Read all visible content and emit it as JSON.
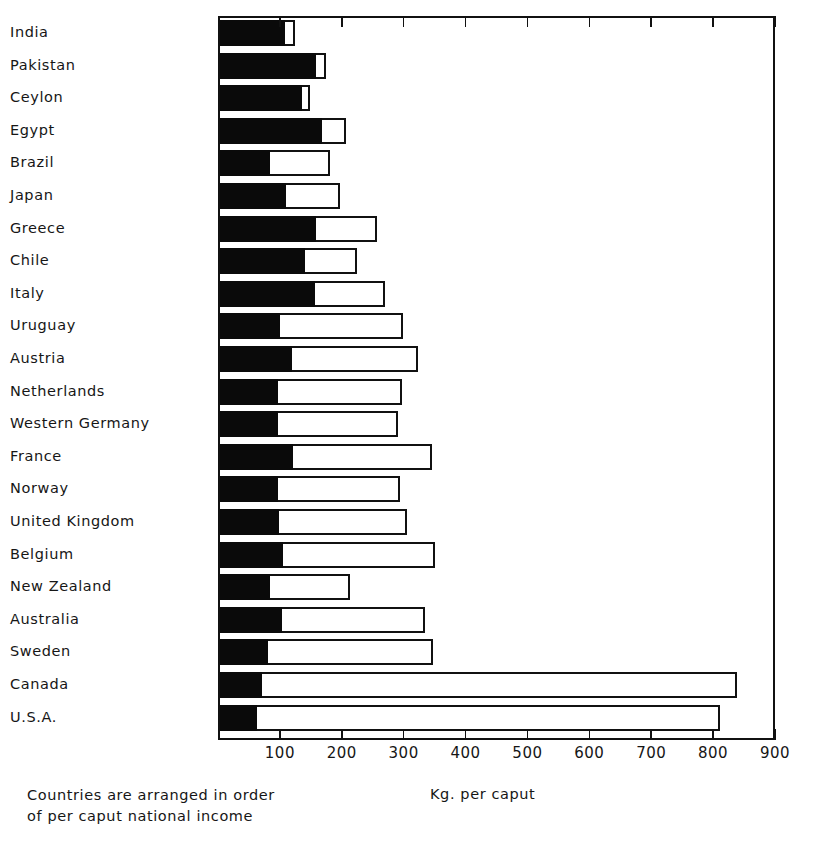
{
  "chart_data": {
    "type": "bar",
    "orientation": "horizontal",
    "stacked": true,
    "title": "",
    "xlabel": "Kg. per caput",
    "ylabel": "",
    "xlim": [
      0,
      900
    ],
    "xticks": [
      100,
      200,
      300,
      400,
      500,
      600,
      700,
      800,
      900
    ],
    "xtick_labels": [
      "100",
      "200",
      "300",
      "400",
      "500",
      "600",
      "700",
      "800",
      "900"
    ],
    "grid": false,
    "legend_position": "none",
    "annotations": [
      "Countries are arranged in order",
      "of per caput national income"
    ],
    "categories": [
      "India",
      "Pakistan",
      "Ceylon",
      "Egypt",
      "Brazil",
      "Japan",
      "Greece",
      "Chile",
      "Italy",
      "Uruguay",
      "Austria",
      "Netherlands",
      "Western Germany",
      "France",
      "Norway",
      "United Kingdom",
      "Belgium",
      "New Zealand",
      "Australia",
      "Sweden",
      "Canada",
      "U.S.A."
    ],
    "series": [
      {
        "name": "direct",
        "color": "#0a0a0a",
        "values": [
          108,
          158,
          136,
          168,
          84,
          110,
          158,
          141,
          157,
          100,
          120,
          97,
          97,
          121,
          97,
          99,
          105,
          84,
          103,
          81,
          71,
          63
        ]
      },
      {
        "name": "indirect",
        "color": "#ffffff",
        "values": [
          16,
          17,
          13,
          39,
          97,
          87,
          99,
          84,
          113,
          199,
          203,
          200,
          194,
          225,
          197,
          206,
          246,
          129,
          231,
          266,
          767,
          748
        ]
      }
    ],
    "totals": [
      124,
      175,
      149,
      207,
      181,
      197,
      257,
      225,
      270,
      299,
      323,
      297,
      291,
      346,
      294,
      305,
      351,
      213,
      334,
      347,
      838,
      811
    ]
  },
  "axis": {
    "x_label": "Kg. per caput"
  },
  "note": {
    "line1": "Countries are arranged in order",
    "line2": "of per caput national income"
  }
}
